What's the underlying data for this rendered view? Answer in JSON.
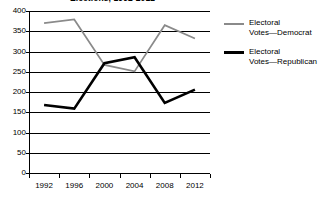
{
  "chart_data": {
    "type": "line",
    "title": "Elections, 1992-2012",
    "xlabel": "",
    "ylabel": "",
    "categories": [
      "1992",
      "1996",
      "2000",
      "2004",
      "2008",
      "2012"
    ],
    "series": [
      {
        "name": "Electoral Votes—Democrat",
        "color": "#8a8a8a",
        "values": [
          370,
          379,
          267,
          251,
          365,
          332
        ]
      },
      {
        "name": "Electoral Votes—Republican",
        "color": "#000000",
        "values": [
          168,
          159,
          271,
          286,
          173,
          206
        ]
      }
    ],
    "ylim": [
      0,
      400
    ],
    "ytick_values": [
      0,
      50,
      100,
      150,
      200,
      250,
      300,
      350,
      400
    ],
    "ytick_labels": [
      "0",
      "50",
      "100",
      "150",
      "200",
      "250",
      "300",
      "350",
      "400"
    ],
    "grid": "horizontal",
    "legend_position": "right"
  },
  "legend": {
    "entries": [
      {
        "label": "Electoral\nVotes—Democrat",
        "color": "#8a8a8a"
      },
      {
        "label": "Electoral\nVotes—Republican",
        "color": "#000000"
      }
    ]
  }
}
